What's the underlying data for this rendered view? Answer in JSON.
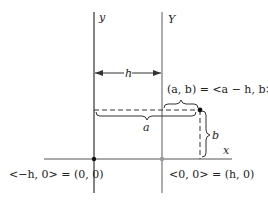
{
  "diagram": {
    "axes": {
      "y_label": "y",
      "Y_label": "Y",
      "x_label": "x"
    },
    "shift": {
      "label": "h"
    },
    "point": {
      "label": "(a, b) = <a − h, b>"
    },
    "braces": {
      "a_label": "a",
      "b_label": "b"
    },
    "origins": {
      "left_label": "<−h, 0> = (0, 0)",
      "right_label": "<0, 0> = (h, 0)"
    },
    "colors": {
      "line": "#333333",
      "secondary_line": "#8a8a8a",
      "background": "#ffffff"
    }
  }
}
